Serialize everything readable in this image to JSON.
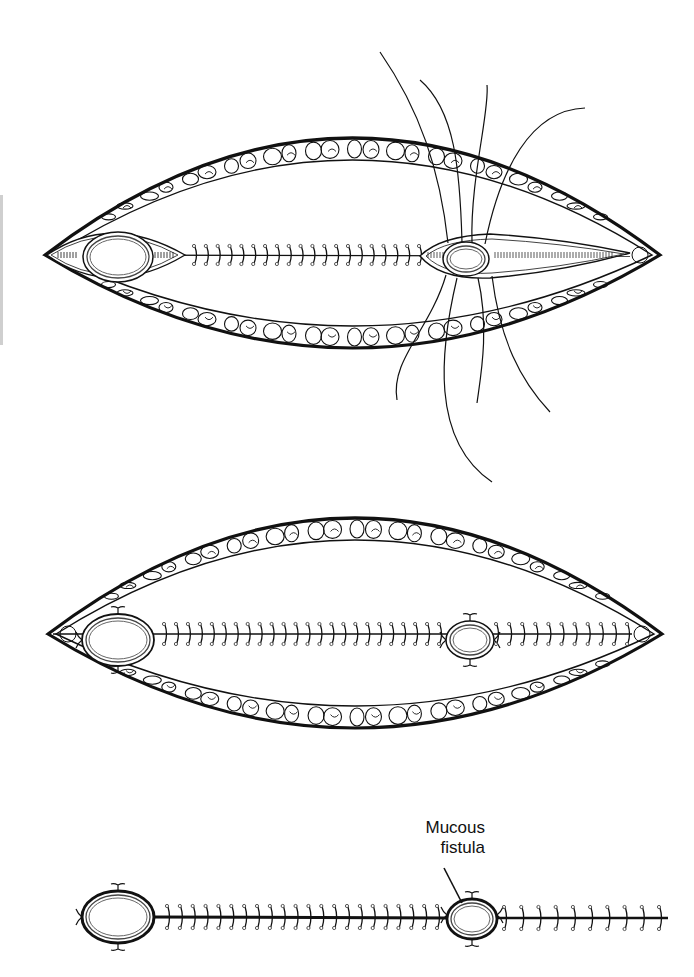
{
  "figure": {
    "colors": {
      "ink": "#111111",
      "paper": "#ffffff",
      "suture_knot": "#555555"
    },
    "panels": [
      {
        "id": "panel-top",
        "description": "Wound with end stoma and mucous fistula being matured; incision closed with interrupted sutures; retention sutures placed around mucous fistula",
        "wound": {
          "left_x": 45,
          "right_x": 660,
          "center_y": 255,
          "top_y": 138,
          "bottom_y": 348
        },
        "stoma_left": {
          "cx": 118,
          "cy": 257,
          "rx": 35,
          "ry": 25
        },
        "stoma_right": {
          "cx": 466,
          "cy": 259,
          "rx": 23,
          "ry": 17
        },
        "midline_sutures": {
          "x_start": 195,
          "x_end": 420,
          "count": 20
        },
        "retention_suture_count": 8
      },
      {
        "id": "panel-middle",
        "description": "Closed wound with both stomas matured; interrupted sutures along the incision",
        "wound": {
          "left_x": 48,
          "right_x": 662,
          "center_y": 634,
          "top_y": 518,
          "bottom_y": 728
        },
        "stoma_left": {
          "cx": 118,
          "cy": 640,
          "rx": 36,
          "ry": 26
        },
        "stoma_right": {
          "cx": 470,
          "cy": 640,
          "rx": 24,
          "ry": 19
        },
        "sutures_segment_1": {
          "x_start": 165,
          "x_end": 440,
          "count": 24
        },
        "sutures_segment_2": {
          "x_start": 497,
          "x_end": 628,
          "count": 11
        }
      },
      {
        "id": "panel-bottom",
        "description": "Skin-level view of the closed incision between the stoma and the mucous fistula",
        "line_y": 917,
        "stoma_left": {
          "cx": 118,
          "cy": 917,
          "rx": 36,
          "ry": 26
        },
        "stoma_right": {
          "cx": 472,
          "cy": 919,
          "rx": 25,
          "ry": 20
        },
        "sutures_segment_1": {
          "x_start": 168,
          "x_end": 438,
          "count": 22
        },
        "sutures_segment_2": {
          "x_start": 505,
          "x_end": 660,
          "count": 10
        },
        "line_end_x": 668,
        "label": {
          "line1": "Mucous",
          "line2": "fistula",
          "x": 385,
          "y": 818,
          "pointer": {
            "x1": 444,
            "y1": 868,
            "x2": 462,
            "y2": 903
          }
        }
      }
    ]
  }
}
